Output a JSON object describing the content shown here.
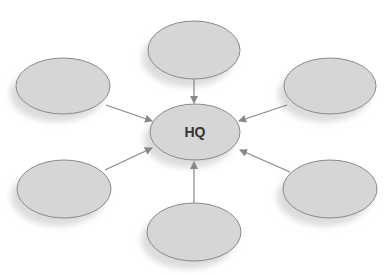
{
  "diagram": {
    "type": "hub-and-spoke",
    "colors": {
      "background": "#ffffff",
      "node_fill": "#d6d6d6",
      "node_stroke": "#8a8a8a",
      "shadow": "#dcdcdc",
      "arrow": "#888888",
      "label": "#333333"
    },
    "hub": {
      "id": "hq",
      "label": "HQ",
      "cx": 195,
      "cy": 132,
      "rx": 45,
      "ry": 28
    },
    "nodes": [
      {
        "id": "top",
        "label": "",
        "cx": 194,
        "cy": 50,
        "rx": 46,
        "ry": 29
      },
      {
        "id": "upper-left",
        "label": "",
        "cx": 63,
        "cy": 86,
        "rx": 47,
        "ry": 28
      },
      {
        "id": "upper-right",
        "label": "",
        "cx": 330,
        "cy": 86,
        "rx": 46,
        "ry": 28
      },
      {
        "id": "lower-left",
        "label": "",
        "cx": 64,
        "cy": 189,
        "rx": 47,
        "ry": 29
      },
      {
        "id": "lower-right",
        "label": "",
        "cx": 330,
        "cy": 189,
        "rx": 47,
        "ry": 29
      },
      {
        "id": "bottom",
        "label": "",
        "cx": 194,
        "cy": 232,
        "rx": 47,
        "ry": 29
      }
    ],
    "edges": [
      {
        "from": "top",
        "to": "hq",
        "x1": 194,
        "y1": 79,
        "x2": 194,
        "y2": 103
      },
      {
        "from": "upper-left",
        "to": "hq",
        "x1": 106,
        "y1": 105,
        "x2": 152,
        "y2": 121
      },
      {
        "from": "upper-right",
        "to": "hq",
        "x1": 287,
        "y1": 105,
        "x2": 239,
        "y2": 121
      },
      {
        "from": "lower-left",
        "to": "hq",
        "x1": 105,
        "y1": 170,
        "x2": 152,
        "y2": 148
      },
      {
        "from": "lower-right",
        "to": "hq",
        "x1": 290,
        "y1": 172,
        "x2": 240,
        "y2": 150
      },
      {
        "from": "bottom",
        "to": "hq",
        "x1": 194,
        "y1": 203,
        "x2": 194,
        "y2": 162
      }
    ]
  }
}
